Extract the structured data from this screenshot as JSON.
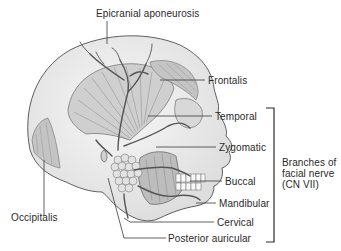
{
  "diagram": {
    "labels": {
      "epicranial_aponeurosis": "Epicranial aponeurosis",
      "frontalis": "Frontalis",
      "temporal": "Temporal",
      "zygomatic": "Zygomatic",
      "buccal": "Buccal",
      "mandibular": "Mandibular",
      "cervical": "Cervical",
      "posterior_auricular": "Posterior auricular",
      "occipitalis": "Occipitalis"
    },
    "group_label": {
      "line1": "Branches of",
      "line2": "facial nerve",
      "line3": "(CN VII)"
    },
    "colors": {
      "line": "#3a3a3a",
      "skull_fill": "#ebebeb",
      "muscle": "#b8b8b8",
      "nerve": "#555555"
    }
  }
}
